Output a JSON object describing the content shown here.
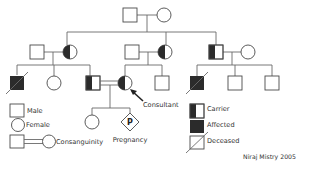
{
  "diagram": {
    "type": "pedigree",
    "colors": {
      "line": "#6a6a6a",
      "symbol_stroke": "#4a4a4a",
      "affected_fill": "#2b2b2b",
      "background": "#ffffff"
    },
    "generations": [
      {
        "id": "I",
        "individuals": [
          {
            "id": "I-1",
            "sex": "male",
            "status": "unaffected"
          },
          {
            "id": "I-2",
            "sex": "female",
            "status": "unaffected"
          }
        ]
      },
      {
        "id": "II",
        "individuals": [
          {
            "id": "II-1",
            "sex": "male",
            "status": "unaffected",
            "note": "spouse"
          },
          {
            "id": "II-2",
            "sex": "female",
            "status": "carrier"
          },
          {
            "id": "II-3",
            "sex": "male",
            "status": "unaffected",
            "note": "spouse"
          },
          {
            "id": "II-4",
            "sex": "female",
            "status": "carrier"
          },
          {
            "id": "II-5",
            "sex": "male",
            "status": "carrier"
          },
          {
            "id": "II-6",
            "sex": "female",
            "status": "unaffected",
            "note": "spouse"
          }
        ]
      },
      {
        "id": "III",
        "individuals": [
          {
            "id": "III-1",
            "sex": "male",
            "status": "affected",
            "deceased": true
          },
          {
            "id": "III-2",
            "sex": "female",
            "status": "unaffected"
          },
          {
            "id": "III-3",
            "sex": "male",
            "status": "carrier"
          },
          {
            "id": "III-4",
            "sex": "female",
            "status": "carrier",
            "consultant": true
          },
          {
            "id": "III-5",
            "sex": "male",
            "status": "unaffected"
          },
          {
            "id": "III-6",
            "sex": "male",
            "status": "affected",
            "deceased": true
          },
          {
            "id": "III-7",
            "sex": "male",
            "status": "unaffected"
          },
          {
            "id": "III-8",
            "sex": "male",
            "status": "unaffected"
          }
        ],
        "consanguineous_union": [
          "III-3",
          "III-4"
        ]
      },
      {
        "id": "IV",
        "individuals": [
          {
            "id": "IV-1",
            "sex": "female",
            "status": "unaffected"
          },
          {
            "id": "IV-2",
            "sex": "unknown",
            "status": "pregnancy",
            "symbol_text": "P"
          }
        ]
      }
    ],
    "annotations": {
      "consultant_label": "Consultant",
      "pregnancy_symbol": "P",
      "pregnancy_label": "Pregnancy"
    },
    "legend": {
      "left": [
        {
          "symbol": "male",
          "label": "Male"
        },
        {
          "symbol": "female",
          "label": "Female"
        },
        {
          "symbol": "consanguinity",
          "label": "Consanguinity"
        }
      ],
      "right": [
        {
          "symbol": "carrier",
          "label": "Carrier"
        },
        {
          "symbol": "affected",
          "label": "Affected"
        },
        {
          "symbol": "deceased",
          "label": "Deceased"
        }
      ]
    },
    "credit": "Niraj Mistry 2005"
  }
}
